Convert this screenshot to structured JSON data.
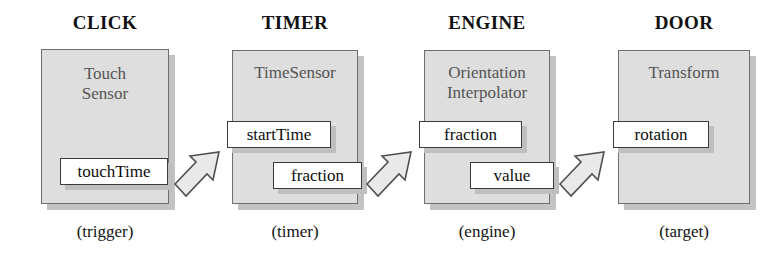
{
  "diagram": {
    "nodes": [
      {
        "header": "CLICK",
        "type_line1": "Touch",
        "type_line2": "Sensor",
        "role": "(trigger)",
        "ports": [
          {
            "label": "touchTime",
            "kind": "out"
          }
        ]
      },
      {
        "header": "TIMER",
        "type_line1": "TimeSensor",
        "type_line2": "",
        "role": "(timer)",
        "ports": [
          {
            "label": "startTime",
            "kind": "in"
          },
          {
            "label": "fraction",
            "kind": "out"
          }
        ]
      },
      {
        "header": "ENGINE",
        "type_line1": "Orientation",
        "type_line2": "Interpolator",
        "role": "(engine)",
        "ports": [
          {
            "label": "fraction",
            "kind": "in"
          },
          {
            "label": "value",
            "kind": "out"
          }
        ]
      },
      {
        "header": "DOOR",
        "type_line1": "Transform",
        "type_line2": "",
        "role": "(target)",
        "ports": [
          {
            "label": "rotation",
            "kind": "in"
          }
        ]
      }
    ],
    "routes": [
      {
        "from": "touchTime",
        "to": "startTime"
      },
      {
        "from": "fraction",
        "to": "fraction"
      },
      {
        "from": "value",
        "to": "rotation"
      }
    ],
    "colors": {
      "node_fill": "#dedede",
      "node_border": "#6e6e6e",
      "port_fill": "#ffffff",
      "port_border": "#3a3a3a",
      "arrow_fill": "#e8e8e8",
      "arrow_stroke": "#4a4a4a",
      "text": "#111111",
      "type_text": "#545454",
      "background": "#ffffff"
    }
  }
}
